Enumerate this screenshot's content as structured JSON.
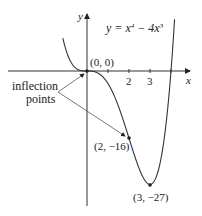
{
  "chart_data": {
    "type": "line",
    "equation_parts": {
      "lhs": "y = x",
      "exp1": "4",
      "mid": " − 4x",
      "exp2": "3"
    },
    "xlabel": "x",
    "ylabel": "y",
    "x_ticks": [
      1,
      2,
      3,
      4
    ],
    "x_tick_labels": [
      "2",
      "3"
    ],
    "xlim": [
      -1.3,
      4.8
    ],
    "ylim": [
      -30,
      17
    ],
    "grid": false,
    "series": [
      {
        "name": "y = x^4 - 4x^3",
        "function": "x^4 - 4x^3",
        "x": [
          -1.1,
          -0.8,
          -0.5,
          0,
          0.5,
          1,
          1.5,
          2,
          2.5,
          3,
          3.5,
          4,
          4.2
        ],
        "y": [
          6.79,
          2.46,
          0.56,
          0,
          -0.44,
          -3,
          -8.44,
          -16,
          -23.44,
          -27,
          -18.38,
          0,
          14.82
        ]
      }
    ],
    "points": [
      {
        "label": "(0, 0)",
        "x": 0,
        "y": 0,
        "type": "inflection"
      },
      {
        "label": "(2, −16)",
        "x": 2,
        "y": -16,
        "type": "inflection"
      },
      {
        "label": "(3, −27)",
        "x": 3,
        "y": -27,
        "type": "minimum"
      }
    ],
    "annotations": [
      {
        "text_line1": "inflection",
        "text_line2": "points",
        "arrows_to": [
          "(0, 0)",
          "(2, −16)"
        ]
      }
    ]
  },
  "labels": {
    "y_axis": "y",
    "x_axis": "x",
    "tick_2": "2",
    "tick_3": "3",
    "origin": "(0, 0)",
    "point_2": "(2, −16)",
    "point_3": "(3, −27)",
    "inflection_1": "inflection",
    "inflection_2": "points"
  }
}
